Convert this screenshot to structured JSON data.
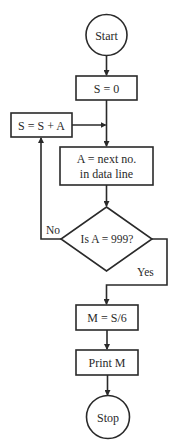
{
  "diagram": {
    "type": "flowchart",
    "nodes": {
      "start": {
        "shape": "circle",
        "label": "Start"
      },
      "init": {
        "shape": "process",
        "label": "S = 0"
      },
      "accumulate": {
        "shape": "process",
        "label": "S = S + A"
      },
      "read": {
        "shape": "process",
        "label_line1": "A = next no.",
        "label_line2": "in data line"
      },
      "decision": {
        "shape": "decision",
        "label": "Is A = 999?"
      },
      "mean": {
        "shape": "process",
        "label": "M = S/6"
      },
      "print": {
        "shape": "process",
        "label": "Print M"
      },
      "stop": {
        "shape": "circle",
        "label": "Stop"
      }
    },
    "edges": {
      "no_label": "No",
      "yes_label": "Yes"
    },
    "colors": {
      "stroke": "#2a2a2a",
      "background": "#ffffff"
    }
  }
}
